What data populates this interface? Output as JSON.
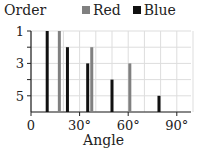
{
  "chart_data": {
    "type": "bar",
    "title": "",
    "xlabel": "Angle",
    "ylabel": "Order",
    "xlim": [
      0,
      100
    ],
    "ylim": [
      6,
      1
    ],
    "x_ticks": [
      "0",
      "30°",
      "60°",
      "90°"
    ],
    "y_ticks": [
      "1",
      "3",
      "5"
    ],
    "grid": true,
    "legend_position": "top",
    "series": [
      {
        "name": "Red",
        "color": "#808080",
        "x": [
          17.5,
          37.5,
          61
        ],
        "values": [
          1,
          2,
          3
        ]
      },
      {
        "name": "Blue",
        "color": "#111111",
        "x": [
          10,
          22.5,
          35,
          50,
          79
        ],
        "values": [
          1,
          2,
          3,
          4,
          5
        ]
      }
    ]
  },
  "labels": {
    "ylabel": "Order",
    "xlabel": "Angle",
    "legend_red": "Red",
    "legend_blue": "Blue"
  }
}
